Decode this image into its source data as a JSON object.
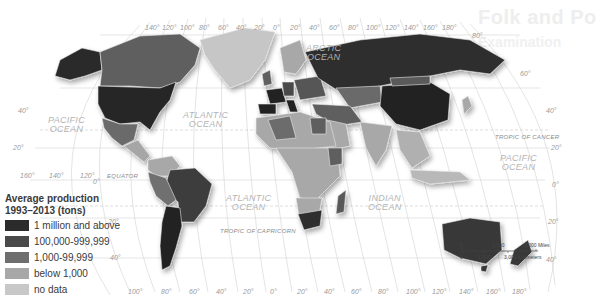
{
  "ghost_title": {
    "line1": "Folk and Po",
    "line2": "Examination"
  },
  "legend": {
    "title_line1": "Average production",
    "title_line2": "1993–2013 (tons)",
    "items": [
      {
        "label": "1 million and above",
        "color": "#2b2b2b"
      },
      {
        "label": "100,000-999,999",
        "color": "#4a4a4a"
      },
      {
        "label": "1,000-99,999",
        "color": "#6e6e6e"
      },
      {
        "label": "below 1,000",
        "color": "#a8a8a8"
      },
      {
        "label": "no data",
        "color": "#c8c8c8"
      }
    ]
  },
  "oceans": {
    "arctic": [
      "ARCTIC",
      "OCEAN"
    ],
    "pacific_west": [
      "PACIFIC",
      "OCEAN"
    ],
    "atlantic_north": [
      "ATLANTIC",
      "OCEAN"
    ],
    "atlantic_south": [
      "ATLANTIC",
      "OCEAN"
    ],
    "indian": [
      "INDIAN",
      "OCEAN"
    ],
    "pacific_east": [
      "PACIFIC",
      "OCEAN"
    ]
  },
  "lines": {
    "equator": "EQUATOR",
    "tropic_cancer": "TROPIC OF CANCER",
    "tropic_capricorn": "TROPIC OF CAPRICORN"
  },
  "top_longitudes": [
    "140°",
    "120°",
    "100°",
    "80°",
    "60°",
    "40°",
    "20°",
    "0°",
    "20°",
    "40°",
    "60°",
    "80°",
    "100°",
    "120°",
    "140°",
    "160°",
    "180°"
  ],
  "bottom_longitudes": [
    "160°",
    "140°",
    "120°",
    "100°",
    "80°",
    "60°",
    "40°",
    "20°",
    "0°",
    "20°",
    "40°",
    "60°",
    "80°",
    "100°",
    "120°",
    "140°",
    "160°",
    "180°"
  ],
  "latitudes_left": [
    "40°",
    "20°",
    "0°",
    "20°",
    "40°"
  ],
  "latitudes_right": [
    "80°",
    "60°",
    "40°",
    "20°",
    "0°",
    "20°",
    "40°"
  ],
  "scale": {
    "miles_0": "0",
    "miles_1": "1,500",
    "miles_2": "3,000 Miles",
    "km_0": "0",
    "km_1": "1,500",
    "km_2": "3,000 Kilometers"
  }
}
